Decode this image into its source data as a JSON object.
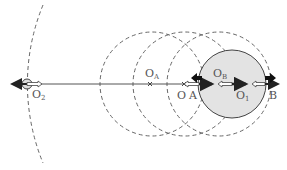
{
  "diagram": {
    "type": "physics-sphere-displacement",
    "labels": {
      "O2": {
        "main": "O",
        "sub": "2"
      },
      "OA": {
        "main": "O",
        "sub": "A"
      },
      "O": {
        "main": "O"
      },
      "A": {
        "main": "A"
      },
      "OB": {
        "main": "O",
        "sub": "B"
      },
      "O1": {
        "main": "O",
        "sub": "1"
      },
      "B": {
        "main": "B"
      }
    },
    "colors": {
      "line": "#555555",
      "dashed": "#666666",
      "sphere_fill": "#e3e3e3",
      "arrow_dark": "#222222"
    }
  }
}
